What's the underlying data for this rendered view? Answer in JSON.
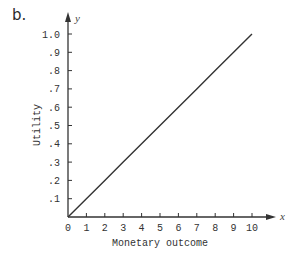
{
  "panel_label": "b.",
  "chart_data": {
    "type": "line",
    "title": "",
    "xlabel": "Monetary outcome",
    "ylabel": "Utility",
    "x_axis_var": "x",
    "y_axis_var": "y",
    "xlim": [
      0,
      10
    ],
    "ylim": [
      0,
      1.0
    ],
    "x_ticks": [
      "0",
      "1",
      "2",
      "3",
      "4",
      "5",
      "6",
      "7",
      "8",
      "9",
      "10"
    ],
    "y_ticks": [
      ".1",
      ".2",
      ".3",
      ".4",
      ".5",
      ".6",
      ".7",
      ".8",
      ".9",
      "1.0"
    ],
    "grid": false,
    "legend": null,
    "series": [
      {
        "name": "Linear utility",
        "x": [
          0,
          1,
          2,
          3,
          4,
          5,
          6,
          7,
          8,
          9,
          10
        ],
        "y": [
          0,
          0.1,
          0.2,
          0.3,
          0.4,
          0.5,
          0.6,
          0.7,
          0.8,
          0.9,
          1.0
        ]
      }
    ]
  },
  "colors": {
    "axis": "#333333",
    "line": "#333333",
    "text": "#333333"
  }
}
